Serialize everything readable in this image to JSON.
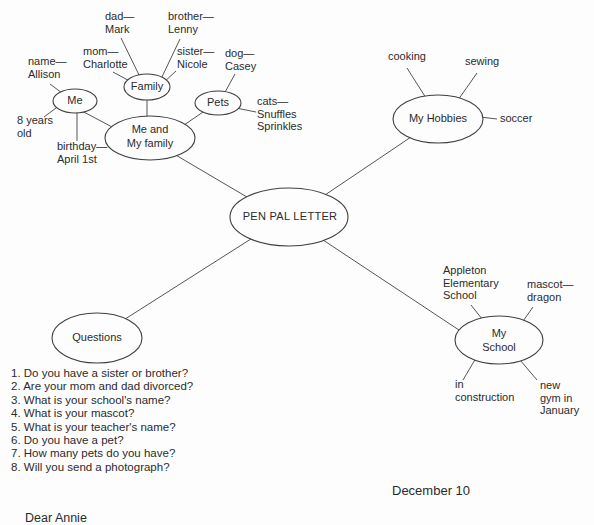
{
  "palette": {
    "paper": "#fdfdfd",
    "ink": "#2b2b2b",
    "line": "#555555",
    "node-stroke": "#3f3f3f"
  },
  "diagram": {
    "center_node": "PEN PAL LETTER",
    "me_branch": {
      "me_node": "Me",
      "family_node": "Family",
      "pets_node": "Pets",
      "me_and_family_node": "Me and\nMy family",
      "name_label": "name—\nAllison",
      "age_label": "8 years\nold",
      "birthday_label": "birthday—\nApril 1st",
      "dad_label": "dad—\nMark",
      "mom_label": "mom—\nCharlotte",
      "brother_label": "brother—\nLenny",
      "sister_label": "sister—\nNicole",
      "dog_label": "dog—\nCasey",
      "cats_label": "cats—\nSnuffles\nSprinkles"
    },
    "hobbies_branch": {
      "node": "My Hobbies",
      "cooking_label": "cooking",
      "sewing_label": "sewing",
      "soccer_label": "soccer"
    },
    "questions_branch": {
      "node": "Questions",
      "items": [
        "1. Do you have a sister or brother?",
        "2. Are your mom and dad divorced?",
        "3. What is your school's name?",
        "4. What is your mascot?",
        "5. What is your teacher's name?",
        "6. Do you have a pet?",
        "7. How many pets do you have?",
        "8. Will you send a photograph?"
      ]
    },
    "school_branch": {
      "node": "My\nSchool",
      "school_name_label": "Appleton\nElementary\nSchool",
      "mascot_label": "mascot—\ndragon",
      "construction_label": "in\nconstruction",
      "gym_label": "new\ngym in\nJanuary"
    }
  },
  "letter": {
    "date": "December 10",
    "salutation": "Dear Annie"
  }
}
